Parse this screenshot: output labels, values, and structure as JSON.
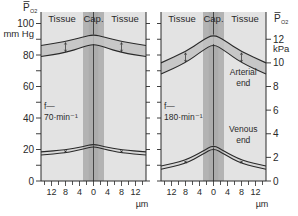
{
  "chart_data": [
    {
      "type": "line",
      "panel": "left",
      "title": "",
      "ylabel": "P̄ O2",
      "ylabel_sub": "O2",
      "yunit": "mm Hg",
      "xlabel": "µm",
      "ylim": [
        0,
        110
      ],
      "xlim": [
        -15,
        15
      ],
      "y_ticks": [
        0,
        20,
        40,
        60,
        80,
        100
      ],
      "y_minor_ticks": [
        10,
        30,
        50,
        70,
        90
      ],
      "x_tick_labels": [
        "12",
        "8",
        "4",
        "0",
        "4",
        "8",
        "12"
      ],
      "x_tick_values": [
        -12,
        -8,
        -4,
        0,
        4,
        8,
        12
      ],
      "region_labels": [
        "Tissue",
        "Cap.",
        "Tissue"
      ],
      "annotation": {
        "line1": "f—",
        "line2": "70·min⁻¹"
      },
      "capillary_halfwidth_um": 3,
      "series": [
        {
          "name": "Arterial end upper",
          "x": [
            -15,
            -8,
            -3,
            0,
            3,
            8,
            15
          ],
          "y": [
            86,
            88.5,
            91.5,
            93,
            91.5,
            88.5,
            86
          ]
        },
        {
          "name": "Arterial end lower",
          "x": [
            -15,
            -8,
            -3,
            0,
            3,
            8,
            15
          ],
          "y": [
            79,
            81.5,
            85,
            87,
            85,
            81.5,
            79
          ]
        },
        {
          "name": "Venous end upper",
          "x": [
            -15,
            -8,
            -3,
            0,
            3,
            8,
            15
          ],
          "y": [
            18.5,
            19.7,
            21.8,
            23.5,
            21.8,
            19.7,
            18.5
          ]
        },
        {
          "name": "Venous end lower",
          "x": [
            -15,
            -8,
            -3,
            0,
            3,
            8,
            15
          ],
          "y": [
            16.5,
            17.8,
            20.2,
            22,
            20.2,
            17.8,
            16.5
          ]
        }
      ]
    },
    {
      "type": "line",
      "panel": "right",
      "title": "",
      "ylabel": "P̄ O2",
      "ylabel_sub": "O2",
      "yunit": "kPa",
      "xlabel": "µm",
      "ylim": [
        0,
        14.7
      ],
      "xlim": [
        -15,
        15
      ],
      "y_ticks": [
        0,
        2,
        4,
        6,
        8,
        10,
        12
      ],
      "x_tick_labels": [
        "12",
        "8",
        "4",
        "0",
        "4",
        "8",
        "12"
      ],
      "x_tick_values": [
        -12,
        -8,
        -4,
        0,
        4,
        8,
        12
      ],
      "region_labels": [
        "Tissue",
        "Cap.",
        "Tissue"
      ],
      "annotation": {
        "line1": "f—",
        "line2": "180·min⁻¹"
      },
      "end_labels": {
        "arterial": [
          "Arterial",
          "end"
        ],
        "venous": [
          "Venous",
          "end"
        ]
      },
      "capillary_halfwidth_um": 3,
      "series": [
        {
          "name": "Arterial end upper",
          "x": [
            -15,
            -8,
            -3,
            0,
            3,
            8,
            15
          ],
          "y_mmHg": [
            75,
            82,
            89.5,
            93,
            89.5,
            82,
            75
          ]
        },
        {
          "name": "Arterial end lower",
          "x": [
            -15,
            -8,
            -3,
            0,
            3,
            8,
            15
          ],
          "y_mmHg": [
            68,
            75,
            83,
            87,
            83,
            75,
            68
          ]
        },
        {
          "name": "Venous end upper",
          "x": [
            -15,
            -8,
            -3,
            0,
            3,
            8,
            15
          ],
          "y_mmHg": [
            9.5,
            13,
            19,
            23,
            19,
            13,
            9.5
          ]
        },
        {
          "name": "Venous end lower",
          "x": [
            -15,
            -8,
            -3,
            0,
            3,
            8,
            15
          ],
          "y_mmHg": [
            7.5,
            11,
            17,
            21,
            17,
            11,
            7.5
          ]
        }
      ]
    }
  ],
  "colors": {
    "panel_bg": "#e3e3e3",
    "band_fill": "#c2c2c2",
    "capillary": "#b3b3b3",
    "capillary_dark": "#a5a5a5",
    "line": "#2a2a2a"
  }
}
